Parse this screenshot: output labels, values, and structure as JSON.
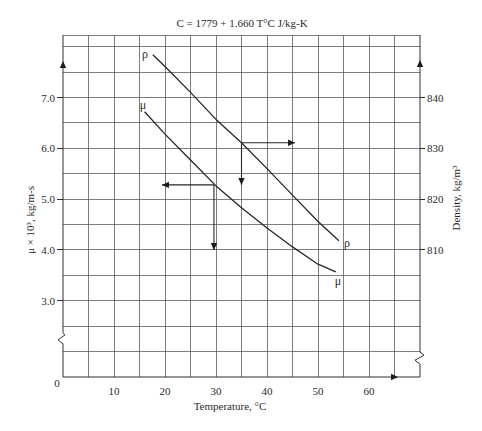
{
  "chart_data": {
    "type": "line",
    "title": "C = 1779 + 1.660 T°C J/kg-K",
    "xlabel": "Temperature, °C",
    "ylabel": "μ × 10³, kg/m-s",
    "ylabel_right": "Density, kg/m³",
    "xlim": [
      0,
      70
    ],
    "x_origin_label": "0",
    "x_ticks": [
      {
        "value": 10,
        "label": "10"
      },
      {
        "value": 20,
        "label": "20"
      },
      {
        "value": 30,
        "label": "30"
      },
      {
        "value": 40,
        "label": "40"
      },
      {
        "value": 50,
        "label": "50"
      },
      {
        "value": 60,
        "label": "60"
      }
    ],
    "y_left": {
      "range": [
        1.5,
        8.23
      ],
      "origin_label": "0",
      "axis_break_at": 2.25,
      "ticks": [
        {
          "value": 3.0,
          "label": "3.0"
        },
        {
          "value": 4.0,
          "label": "4.0"
        },
        {
          "value": 5.0,
          "label": "5.0"
        },
        {
          "value": 6.0,
          "label": "6.0"
        },
        {
          "value": 7.0,
          "label": "7.0"
        }
      ]
    },
    "y_right": {
      "range": [
        785.0,
        852.3
      ],
      "axis_break_at": 788.7,
      "ticks": [
        {
          "value": 810,
          "label": "810"
        },
        {
          "value": 820,
          "label": "820"
        },
        {
          "value": 830,
          "label": "830"
        },
        {
          "value": 840,
          "label": "840"
        }
      ]
    },
    "grid": {
      "on": true,
      "x_step": 5,
      "y_step_left": 0.5
    },
    "legend": {
      "position": "inline curve labels at both ends"
    },
    "series": [
      {
        "name": "viscosity μ × 10³ (kg/m-s)",
        "symbol": "μ",
        "axis": "left",
        "x": [
          16,
          20,
          25,
          30,
          35,
          40,
          45,
          50,
          53.5
        ],
        "y": [
          6.72,
          6.28,
          5.77,
          5.26,
          4.83,
          4.43,
          4.06,
          3.72,
          3.57
        ],
        "label_start": [
          15.7,
          6.85
        ],
        "label_end": [
          53.9,
          3.39
        ]
      },
      {
        "name": "density ρ (kg/m³)",
        "symbol": "ρ",
        "axis": "right",
        "x": [
          17.6,
          20,
          25,
          30,
          35,
          40,
          45,
          50,
          54.1
        ],
        "y": [
          848.4,
          846.1,
          841.0,
          835.7,
          831.1,
          826.0,
          820.8,
          815.6,
          811.8
        ],
        "label_start": [
          16.1,
          848.6
        ],
        "label_end": [
          55.7,
          811.4
        ]
      }
    ],
    "annotations": [
      {
        "series": "ρ",
        "axis": "right",
        "at": [
          35,
          831.1
        ],
        "horizontal_to_x": 45.5,
        "horizontal_direction": "right",
        "vertical_to_y": 822.8,
        "vertical_direction": "down"
      },
      {
        "series": "μ",
        "axis": "left",
        "at": [
          29.6,
          5.28
        ],
        "horizontal_to_x": 19.4,
        "horizontal_direction": "left",
        "vertical_to_y": 4.0,
        "vertical_direction": "down"
      }
    ],
    "axis_arrows": [
      {
        "axis": "left",
        "direction": "up",
        "at": 7.72
      },
      {
        "axis": "right",
        "direction": "up",
        "at": 847.4
      },
      {
        "axis": "bottom",
        "direction": "right",
        "at": 65.7
      }
    ]
  }
}
